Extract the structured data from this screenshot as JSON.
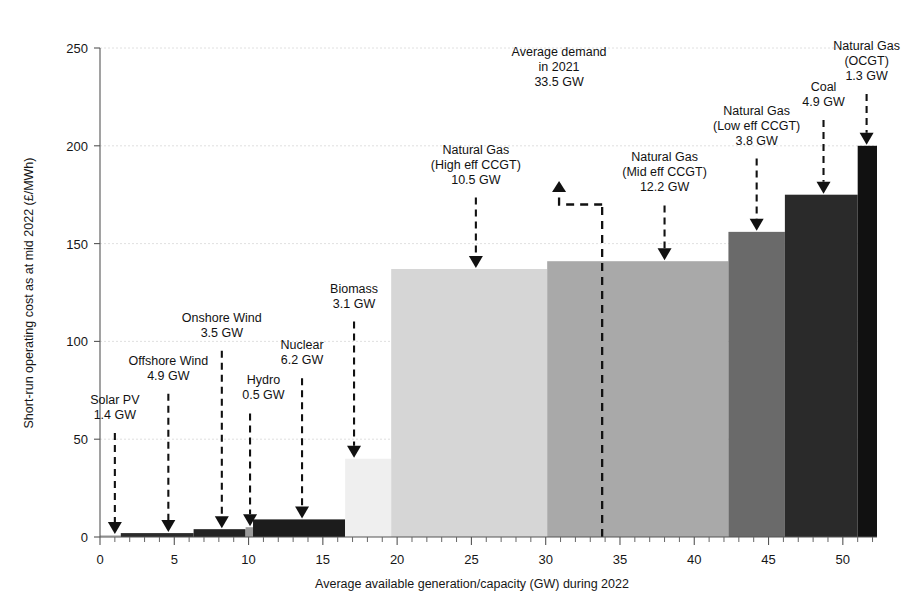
{
  "chart_data": {
    "type": "bar",
    "title": "",
    "xlabel": "Average available generation/capacity (GW) during 2022",
    "ylabel": "Short-run operating cost as at mid 2022 (£/MWh)",
    "xlim": [
      0,
      52.3
    ],
    "ylim": [
      0,
      250
    ],
    "xticks": [
      0,
      5,
      10,
      15,
      20,
      25,
      30,
      35,
      40,
      45,
      50
    ],
    "yticks": [
      0,
      50,
      100,
      150,
      200,
      250
    ],
    "xtick_labels": [
      "0",
      "5",
      "10",
      "15",
      "20",
      "25",
      "30",
      "35",
      "40",
      "45",
      "50"
    ],
    "ytick_labels": [
      "0",
      "50",
      "100",
      "150",
      "200",
      "250"
    ],
    "xtick_minor_step": 1,
    "grid": true,
    "grid_axis": "y",
    "legend": "none",
    "note": "Merit order / supply stack: bars are stacked left-to-right by capacity width (GW) and height equals short-run operating cost (£/MWh).",
    "bars": [
      {
        "name": "Solar PV",
        "capacity_gw": 1.4,
        "cost_gbp_per_mwh": 1,
        "x_start": 0.0,
        "x_end": 1.4,
        "color": "#c9c9c9"
      },
      {
        "name": "Offshore Wind",
        "capacity_gw": 4.9,
        "cost_gbp_per_mwh": 2,
        "x_start": 1.4,
        "x_end": 6.3,
        "color": "#2b2b2b"
      },
      {
        "name": "Onshore Wind",
        "capacity_gw": 3.5,
        "cost_gbp_per_mwh": 4,
        "x_start": 6.3,
        "x_end": 9.8,
        "color": "#232323"
      },
      {
        "name": "Hydro",
        "capacity_gw": 0.5,
        "cost_gbp_per_mwh": 5,
        "x_start": 9.8,
        "x_end": 10.3,
        "color": "#9a9a9a"
      },
      {
        "name": "Nuclear",
        "capacity_gw": 6.2,
        "cost_gbp_per_mwh": 9,
        "x_start": 10.3,
        "x_end": 16.5,
        "color": "#1c1c1c"
      },
      {
        "name": "Biomass",
        "capacity_gw": 3.1,
        "cost_gbp_per_mwh": 40,
        "x_start": 16.5,
        "x_end": 19.6,
        "color": "#efefef"
      },
      {
        "name": "Natural Gas (High eff CCGT)",
        "capacity_gw": 10.5,
        "cost_gbp_per_mwh": 137,
        "x_start": 19.6,
        "x_end": 30.1,
        "color": "#d6d6d6"
      },
      {
        "name": "Natural Gas (Mid eff CCGT)",
        "capacity_gw": 12.2,
        "cost_gbp_per_mwh": 141,
        "x_start": 30.1,
        "x_end": 42.3,
        "color": "#a9a9a9"
      },
      {
        "name": "Natural Gas (Low eff CCGT)",
        "capacity_gw": 3.8,
        "cost_gbp_per_mwh": 156,
        "x_start": 42.3,
        "x_end": 46.1,
        "color": "#6a6a6a"
      },
      {
        "name": "Coal",
        "capacity_gw": 4.9,
        "cost_gbp_per_mwh": 175,
        "x_start": 46.1,
        "x_end": 51.0,
        "color": "#2a2a2a"
      },
      {
        "name": "Natural Gas (OCGT)",
        "capacity_gw": 1.3,
        "cost_gbp_per_mwh": 200,
        "x_start": 51.0,
        "x_end": 52.3,
        "color": "#111111"
      }
    ],
    "annotations": [
      {
        "id": "solar-pv",
        "lines": [
          "Solar PV",
          "1.4 GW"
        ],
        "target_x": 1.0,
        "target_y": 1,
        "text_x": 1.0,
        "text_top_y": 68
      },
      {
        "id": "offshore-wind",
        "lines": [
          "Offshore Wind",
          "4.9 GW"
        ],
        "target_x": 4.6,
        "target_y": 2,
        "text_x": 4.6,
        "text_top_y": 88
      },
      {
        "id": "onshore-wind",
        "lines": [
          "Onshore Wind",
          "3.5 GW"
        ],
        "target_x": 8.2,
        "target_y": 4,
        "text_x": 8.2,
        "text_top_y": 110
      },
      {
        "id": "hydro",
        "lines": [
          "Hydro",
          "0.5 GW"
        ],
        "target_x": 10.1,
        "target_y": 5,
        "text_x": 11.0,
        "text_top_y": 78
      },
      {
        "id": "nuclear",
        "lines": [
          "Nuclear",
          "6.2 GW"
        ],
        "target_x": 13.6,
        "target_y": 9,
        "text_x": 13.6,
        "text_top_y": 96
      },
      {
        "id": "biomass",
        "lines": [
          "Biomass",
          "3.1 GW"
        ],
        "target_x": 17.1,
        "target_y": 40,
        "text_x": 17.1,
        "text_top_y": 125
      },
      {
        "id": "high-eff-ccgt",
        "lines": [
          "Natural Gas",
          "(High eff CCGT)",
          "10.5 GW"
        ],
        "target_x": 25.3,
        "target_y": 137,
        "text_x": 25.3,
        "text_top_y": 196
      },
      {
        "id": "average-demand",
        "lines": [
          "Average demand",
          "in 2021",
          "33.5 GW"
        ],
        "target_x": 30.9,
        "target_y": 180,
        "text_x": 30.9,
        "text_top_y": 246,
        "direction": "up"
      },
      {
        "id": "mid-eff-ccgt",
        "lines": [
          "Natural Gas",
          "(Mid eff CCGT)",
          "12.2 GW"
        ],
        "target_x": 38.0,
        "target_y": 141,
        "text_x": 38.0,
        "text_top_y": 192
      },
      {
        "id": "low-eff-ccgt",
        "lines": [
          "Natural Gas",
          "(Low eff CCGT)",
          "3.8 GW"
        ],
        "target_x": 44.2,
        "target_y": 156,
        "text_x": 44.2,
        "text_top_y": 216
      },
      {
        "id": "coal",
        "lines": [
          "Coal",
          "4.9 GW"
        ],
        "target_x": 48.7,
        "target_y": 175,
        "text_x": 48.7,
        "text_top_y": 228
      },
      {
        "id": "ocgt",
        "lines": [
          "Natural Gas",
          "(OCGT)",
          "1.3 GW"
        ],
        "target_x": 51.6,
        "target_y": 200,
        "text_x": 51.6,
        "text_top_y": 249
      }
    ],
    "demand_marker": {
      "label_lines": [
        "Average demand",
        "in 2021",
        "33.5 GW"
      ],
      "value_gw": 33.5,
      "x": 33.8,
      "arrow_x": 30.9,
      "arrow_tip_y": 182,
      "elbow_y": 170
    }
  }
}
